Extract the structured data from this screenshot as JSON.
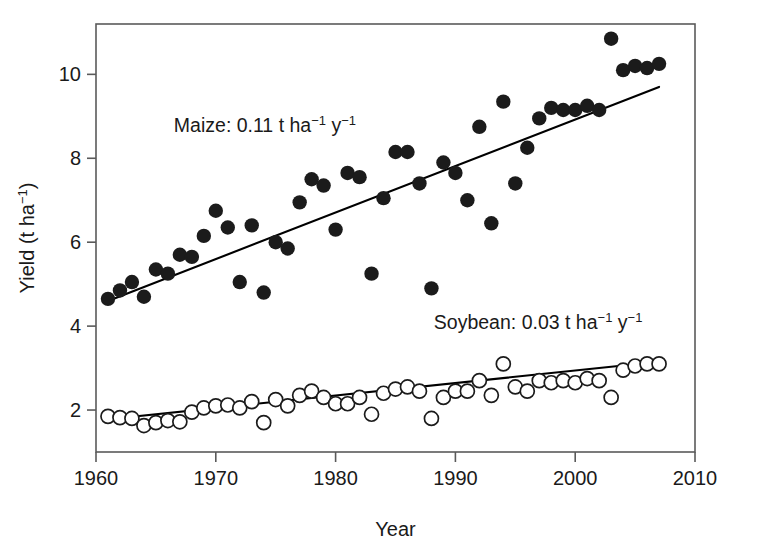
{
  "chart_data": {
    "type": "scatter",
    "title": "",
    "xlabel": "Year",
    "ylabel": "Yield (t ha⁻¹)",
    "xlim": [
      1960,
      2010
    ],
    "ylim": [
      1.0,
      11.2
    ],
    "xticks": [
      1960,
      1970,
      1980,
      1990,
      2000,
      2010
    ],
    "yticks": [
      2,
      4,
      6,
      8,
      10
    ],
    "grid": false,
    "legend_position": "in-plot annotations",
    "annotations": [
      {
        "name": "maize-annotation",
        "text_plain": "Maize: 0.11 t ha−1 y−1",
        "prefix": "Maize: 0.11 t ha",
        "sup1": "−1",
        "mid": " y",
        "sup2": "−1",
        "x": 1966.5,
        "y": 8.62
      },
      {
        "name": "soybean-annotation",
        "text_plain": "Soybean: 0.03 t ha−1 y−1",
        "prefix": "Soybean: 0.03 t ha",
        "sup1": "−1",
        "mid": " y",
        "sup2": "−1",
        "x": 1988.2,
        "y": 3.92
      }
    ],
    "series": [
      {
        "name": "Maize",
        "marker": "filled-circle",
        "color": "#1b1b1b",
        "slope_t_ha_y": 0.11,
        "x": [
          1961,
          1962,
          1963,
          1964,
          1965,
          1966,
          1967,
          1968,
          1969,
          1970,
          1971,
          1972,
          1973,
          1974,
          1975,
          1976,
          1977,
          1978,
          1979,
          1980,
          1981,
          1982,
          1983,
          1984,
          1985,
          1986,
          1987,
          1988,
          1989,
          1990,
          1991,
          1992,
          1993,
          1994,
          1995,
          1996,
          1997,
          1998,
          1999,
          2000,
          2001,
          2002,
          2003,
          2004,
          2005,
          2006,
          2007
        ],
        "y": [
          4.65,
          4.85,
          5.05,
          4.7,
          5.35,
          5.25,
          5.7,
          5.65,
          6.15,
          6.75,
          6.35,
          5.05,
          6.4,
          4.8,
          6.0,
          5.85,
          6.95,
          7.5,
          7.35,
          6.3,
          7.65,
          7.55,
          5.25,
          7.05,
          8.15,
          8.15,
          7.4,
          4.9,
          7.9,
          7.65,
          7.0,
          8.75,
          6.45,
          9.35,
          7.4,
          8.25,
          8.95,
          9.2,
          9.15,
          9.15,
          9.25,
          9.15,
          10.85,
          10.1,
          10.2,
          10.15,
          10.25
        ],
        "fit_line": {
          "x1": 1961,
          "y1": 4.6,
          "x2": 2007,
          "y2": 9.7
        }
      },
      {
        "name": "Soybean",
        "marker": "open-circle",
        "color": "#1b1b1b",
        "slope_t_ha_y": 0.03,
        "x": [
          1961,
          1962,
          1963,
          1964,
          1965,
          1966,
          1967,
          1968,
          1969,
          1970,
          1971,
          1972,
          1973,
          1974,
          1975,
          1976,
          1977,
          1978,
          1979,
          1980,
          1981,
          1982,
          1983,
          1984,
          1985,
          1986,
          1987,
          1988,
          1989,
          1990,
          1991,
          1992,
          1993,
          1994,
          1995,
          1996,
          1997,
          1998,
          1999,
          2000,
          2001,
          2002,
          2003,
          2004,
          2005,
          2006,
          2007
        ],
        "x_note": "annual soybean yields 1961-2007",
        "y": [
          1.85,
          1.82,
          1.8,
          1.63,
          1.7,
          1.75,
          1.72,
          1.95,
          2.05,
          2.1,
          2.12,
          2.05,
          2.2,
          1.7,
          2.25,
          2.1,
          2.35,
          2.45,
          2.3,
          2.15,
          2.15,
          2.3,
          1.9,
          2.4,
          2.5,
          2.55,
          2.45,
          1.8,
          2.3,
          2.45,
          2.45,
          2.7,
          2.35,
          3.1,
          2.55,
          2.45,
          2.7,
          2.65,
          2.7,
          2.65,
          2.75,
          2.7,
          2.3,
          2.95,
          3.05,
          3.1,
          3.1
        ],
        "fit_line": {
          "x1": 1961,
          "y1": 1.78,
          "x2": 2007,
          "y2": 3.15
        }
      }
    ]
  }
}
